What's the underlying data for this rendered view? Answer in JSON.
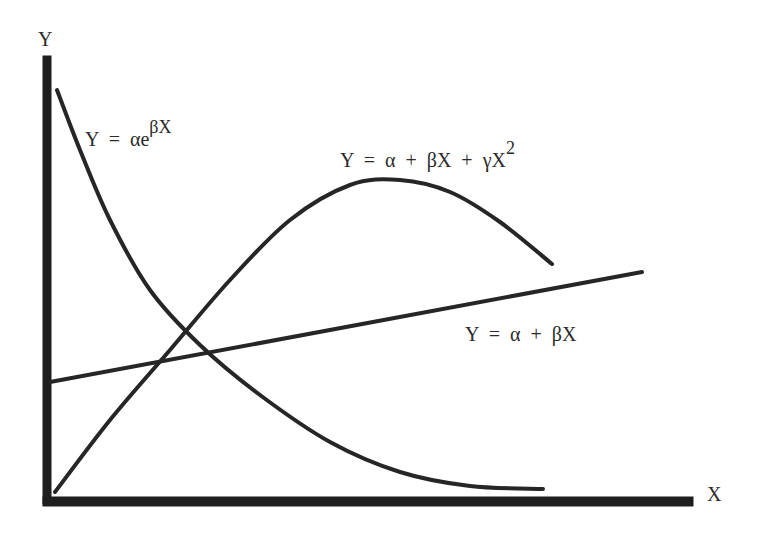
{
  "chart_data": {
    "type": "line",
    "title": "",
    "xlabel": "X",
    "ylabel": "Y",
    "grid": false,
    "legend": "inline annotations",
    "series": [
      {
        "name": "exponential",
        "equation": "Y = αe^(βX)",
        "label_main": "Y  =  αe",
        "label_sup": "βX",
        "points": [
          [
            57,
            90
          ],
          [
            80,
            150
          ],
          [
            110,
            220
          ],
          [
            150,
            290
          ],
          [
            200,
            345
          ],
          [
            260,
            395
          ],
          [
            330,
            442
          ],
          [
            400,
            472
          ],
          [
            470,
            486
          ],
          [
            543,
            489
          ]
        ]
      },
      {
        "name": "quadratic",
        "equation": "Y = α + βX + γX^2",
        "label_main": "Y  =  α  +  βX  +  γX",
        "label_sup": "2",
        "points": [
          [
            55,
            492
          ],
          [
            110,
            420
          ],
          [
            170,
            350
          ],
          [
            230,
            280
          ],
          [
            290,
            220
          ],
          [
            350,
            185
          ],
          [
            400,
            180
          ],
          [
            450,
            192
          ],
          [
            500,
            222
          ],
          [
            552,
            264
          ]
        ]
      },
      {
        "name": "linear",
        "equation": "Y = α + βX",
        "label_main": "Y  =  α  +  βX",
        "label_sup": "",
        "points": [
          [
            50,
            382
          ],
          [
            642,
            272
          ]
        ]
      }
    ]
  },
  "axes": {
    "x_label": "X",
    "y_label": "Y"
  }
}
